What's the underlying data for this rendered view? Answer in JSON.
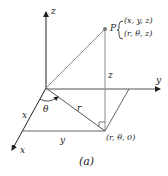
{
  "figure": {
    "caption": "(a)",
    "axes": {
      "x_label": "x",
      "y_label": "y",
      "z_label": "z"
    },
    "point": {
      "name": "P",
      "cartesian": "(x, y, z)",
      "cylindrical": "(r, θ, z)"
    },
    "projection_label": "(r, θ, 0)",
    "segment_labels": {
      "height": "z",
      "radius": "r",
      "angle": "θ",
      "x_length": "x",
      "y_length": "y"
    },
    "colors": {
      "axis": "#222222",
      "construction_line": "#8a8a8a",
      "point": "#777777"
    }
  }
}
